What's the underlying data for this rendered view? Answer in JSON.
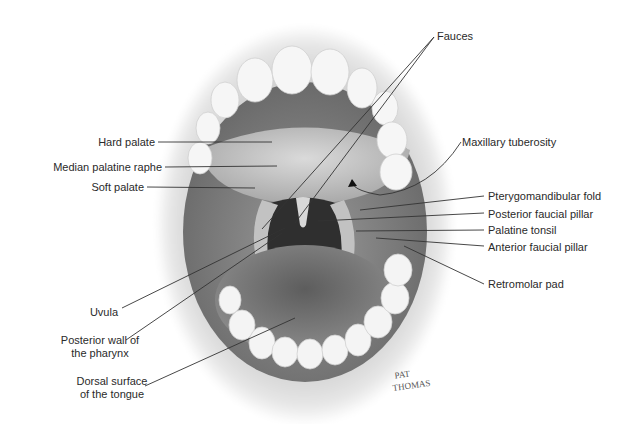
{
  "figure": {
    "signature": "PAT THOMAS"
  },
  "labels": {
    "left": [
      {
        "id": "hard-palate",
        "text": "Hard palate"
      },
      {
        "id": "median-palatine-raphe",
        "text": "Median palatine raphe"
      },
      {
        "id": "soft-palate",
        "text": "Soft palate"
      },
      {
        "id": "uvula",
        "text": "Uvula"
      },
      {
        "id": "posterior-wall-pharynx",
        "line1": "Posterior wall of",
        "line2": "the pharynx"
      },
      {
        "id": "dorsal-surface-tongue",
        "line1": "Dorsal surface",
        "line2": "of the tongue"
      }
    ],
    "right": [
      {
        "id": "fauces",
        "text": "Fauces"
      },
      {
        "id": "maxillary-tuberosity",
        "text": "Maxillary tuberosity"
      },
      {
        "id": "pterygomandibular-fold",
        "text": "Pterygomandibular fold"
      },
      {
        "id": "posterior-faucial-pillar",
        "text": "Posterior faucial pillar"
      },
      {
        "id": "palatine-tonsil",
        "text": "Palatine tonsil"
      },
      {
        "id": "anterior-faucial-pillar",
        "text": "Anterior faucial pillar"
      },
      {
        "id": "retromolar-pad",
        "text": "Retromolar pad"
      }
    ]
  },
  "colors": {
    "label_text": "#2a2a2a",
    "leader_line": "#333333",
    "lip": "#bdbdbd",
    "teeth": "#f4f4f4",
    "palate": "#c9c9c9",
    "throat": "#3a3a3a",
    "tongue": "#7d7d7d"
  }
}
